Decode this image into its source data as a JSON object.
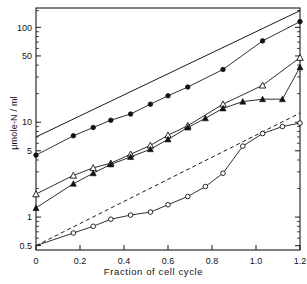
{
  "chart_data": {
    "type": "line",
    "title": "",
    "xlabel": "Fraction of cell cycle",
    "ylabel": "μmole-N / ml",
    "yscale": "log",
    "xlim": [
      0,
      1.2
    ],
    "ylim": [
      0.45,
      160
    ],
    "grid": false,
    "legend": "none",
    "xticks": [
      "0",
      "0.2",
      "0.4",
      "0.6",
      "0.8",
      "1.0",
      "1.2"
    ],
    "xtickvals": [
      0,
      0.2,
      0.4,
      0.6,
      0.8,
      1.0,
      1.2
    ],
    "yticks": [
      "0.5",
      "1",
      "5",
      "10",
      "50",
      "100"
    ],
    "ytickvals": [
      0.5,
      1,
      5,
      10,
      50,
      100
    ],
    "series": [
      {
        "name": "upper-reference-line",
        "marker": "none",
        "linestyle": "solid",
        "x": [
          0.0,
          1.2
        ],
        "y": [
          7.0,
          150.0
        ]
      },
      {
        "name": "filled-circles",
        "marker": "filled-circle",
        "linestyle": "solid",
        "x": [
          0.0,
          0.17,
          0.26,
          0.34,
          0.43,
          0.52,
          0.6,
          0.69,
          0.85,
          1.03,
          1.2
        ],
        "y": [
          4.5,
          7.2,
          8.8,
          10.5,
          12.2,
          15.5,
          19.0,
          23.5,
          36.0,
          72.0,
          115.0
        ]
      },
      {
        "name": "open-triangles",
        "marker": "open-triangle",
        "linestyle": "solid",
        "x": [
          0.0,
          0.17,
          0.26,
          0.34,
          0.43,
          0.52,
          0.6,
          0.69,
          0.85,
          1.03,
          1.2
        ],
        "y": [
          1.75,
          2.75,
          3.3,
          3.7,
          4.6,
          5.7,
          7.3,
          9.2,
          15.5,
          24.5,
          48.0
        ]
      },
      {
        "name": "filled-triangles",
        "marker": "filled-triangle",
        "linestyle": "solid",
        "x": [
          0.0,
          0.17,
          0.26,
          0.34,
          0.43,
          0.52,
          0.6,
          0.69,
          0.77,
          0.85,
          0.94,
          1.03,
          1.12,
          1.2
        ],
        "y": [
          1.25,
          2.25,
          2.9,
          3.6,
          4.3,
          5.2,
          6.6,
          8.8,
          11.0,
          14.0,
          16.5,
          17.5,
          17.5,
          38.0
        ]
      },
      {
        "name": "dashed-reference-line",
        "marker": "none",
        "linestyle": "dashed",
        "x": [
          0.0,
          1.2
        ],
        "y": [
          0.5,
          12.5
        ]
      },
      {
        "name": "open-circles",
        "marker": "open-circle",
        "linestyle": "solid",
        "x": [
          0.0,
          0.17,
          0.26,
          0.34,
          0.43,
          0.52,
          0.6,
          0.69,
          0.77,
          0.85,
          0.94,
          1.03,
          1.12,
          1.2
        ],
        "y": [
          0.5,
          0.68,
          0.8,
          0.95,
          1.05,
          1.13,
          1.35,
          1.65,
          2.1,
          2.9,
          5.6,
          7.6,
          9.0,
          9.8
        ]
      }
    ]
  }
}
